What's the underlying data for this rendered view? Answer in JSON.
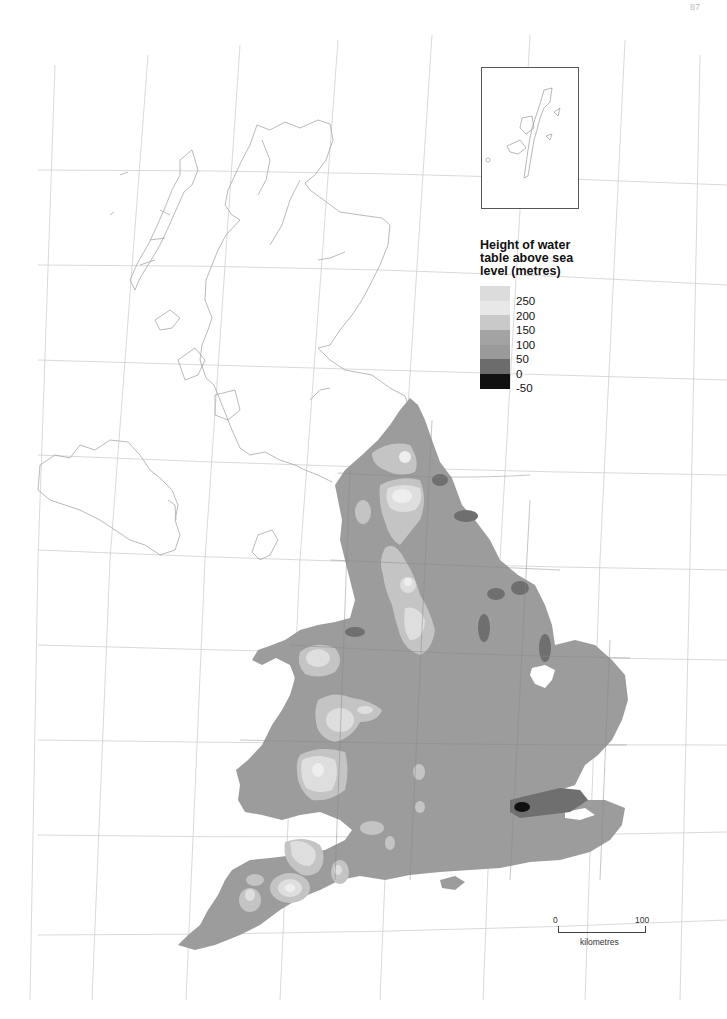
{
  "page": {
    "number": "87"
  },
  "legend": {
    "title": "Height of water table above sea level (metres)",
    "title_lines": [
      "Height of water",
      "table above sea",
      "level (metres)"
    ],
    "classes": [
      {
        "label": "250",
        "color": "#dcdcdc"
      },
      {
        "label": "200",
        "color": "#e6e6e6"
      },
      {
        "label": "150",
        "color": "#c9c9c9"
      },
      {
        "label": "100",
        "color": "#a3a3a3"
      },
      {
        "label": "50",
        "color": "#9a9a9a"
      },
      {
        "label": "0",
        "color": "#6c6c6c"
      },
      {
        "label": "-50",
        "color": "#111111"
      }
    ]
  },
  "inset": {
    "subject": "Shetland Islands outline"
  },
  "scale_bar": {
    "start": "0",
    "end": "100",
    "unit": "kilometres"
  },
  "map": {
    "subject": "England and Wales groundwater table height",
    "outline_regions": [
      "Scotland",
      "Northern Ireland",
      "Isle of Man"
    ],
    "colors": {
      "land_base": "#9c9c9c",
      "low_0_50": "#6f6f6f",
      "high_150_200": "#c4c4c4",
      "high_200_250": "#dddddd",
      "peak_250": "#ececec",
      "below_sea": "#111111",
      "graticule": "#c8c8c8",
      "coastline": "#a0a0a0"
    }
  }
}
